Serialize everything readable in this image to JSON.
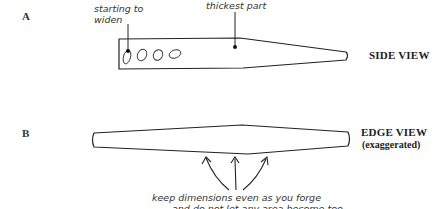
{
  "figure": {
    "part_a": {
      "letter": "A",
      "view_label": "SIDE VIEW",
      "annotations": {
        "starting_to_widen_line1": "starting to",
        "starting_to_widen_line2": "widen",
        "thickest_part": "thickest part"
      },
      "holes_count": 4
    },
    "part_b": {
      "letter": "B",
      "view_label": "EDGE VIEW",
      "view_sublabel": "(exaggerated)",
      "annotation_line1": "keep dimensions even as you forge",
      "annotation_line2_clipped": "and do not let any area become too"
    },
    "colors": {
      "ink": "#222222",
      "background": "#ffffff"
    }
  }
}
